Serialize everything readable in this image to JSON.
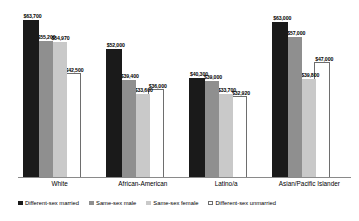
{
  "chart_data": {
    "type": "bar",
    "title": "",
    "xlabel": "",
    "ylabel": "",
    "grid": false,
    "legend_position": "bottom",
    "ylim": [
      0,
      70000
    ],
    "categories": [
      "White",
      "African-American",
      "Latino/a",
      "Asian/Pacific Islander"
    ],
    "series": [
      {
        "name": "Different-sex married",
        "color": "#1a1a1a",
        "values": [
          63700,
          52000,
          40300,
          63000
        ],
        "labels": [
          "$63,700",
          "$52,000",
          "$40,300",
          "$63,000"
        ]
      },
      {
        "name": "Same-sex male",
        "color": "#8f8f8f",
        "values": [
          55200,
          39400,
          39000,
          57000
        ],
        "labels": [
          "$55,200",
          "$39,400",
          "$39,000",
          "$57,000"
        ]
      },
      {
        "name": "Same-sex female",
        "color": "#c9c9c9",
        "values": [
          54970,
          33600,
          33700,
          39800
        ],
        "labels": [
          "$54,970",
          "$33,600",
          "$33,700",
          "$39,800"
        ]
      },
      {
        "name": "Different-sex unmarried",
        "color": "#ffffff",
        "values": [
          42500,
          36000,
          32920,
          47000
        ],
        "labels": [
          "$42,500",
          "$36,000",
          "$32,920",
          "$47,000"
        ]
      }
    ]
  },
  "legend": {
    "items": [
      {
        "label": "Different-sex married"
      },
      {
        "label": "Same-sex male"
      },
      {
        "label": "Same-sex female"
      },
      {
        "label": "Different-sex unmarried"
      }
    ]
  }
}
